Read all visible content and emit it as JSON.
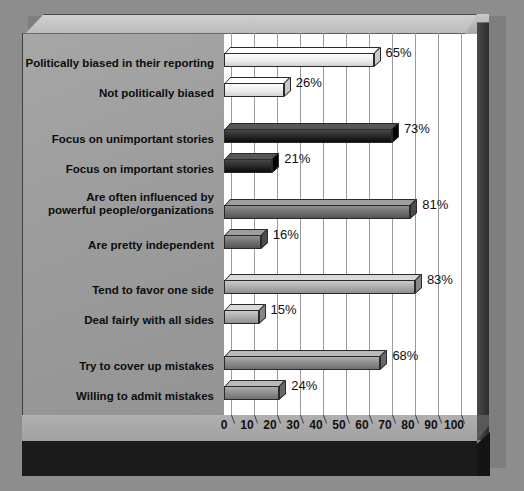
{
  "chart_data": {
    "type": "bar",
    "orientation": "horizontal",
    "title": "",
    "xlabel": "Percent",
    "ylabel": "",
    "xlim": [
      0,
      100
    ],
    "xticks": [
      0,
      10,
      20,
      30,
      40,
      50,
      60,
      70,
      80,
      90,
      100
    ],
    "grid": true,
    "legend": "none",
    "categories": [
      "Politically biased in their reporting",
      "Not politically biased",
      "Focus on unimportant stories",
      "Focus on important stories",
      "Are often influenced by powerful people/organizations",
      "Are pretty independent",
      "Tend to favor one side",
      "Deal fairly with all sides",
      "Try to cover up mistakes",
      "Willing to admit mistakes"
    ],
    "values": [
      65,
      26,
      73,
      21,
      81,
      16,
      83,
      15,
      68,
      24
    ],
    "value_labels": [
      "65%",
      "26%",
      "73%",
      "21%",
      "81%",
      "16%",
      "83%",
      "15%",
      "68%",
      "24%"
    ],
    "groups": [
      {
        "color": "#ececec",
        "items": [
          {
            "label": "Politically biased in their reporting",
            "value": 65,
            "value_label": "65%"
          },
          {
            "label": "Not politically biased",
            "value": 26,
            "value_label": "26%"
          }
        ]
      },
      {
        "color": "#262626",
        "items": [
          {
            "label": "Focus on unimportant stories",
            "value": 73,
            "value_label": "73%"
          },
          {
            "label": "Focus on important stories",
            "value": 21,
            "value_label": "21%"
          }
        ]
      },
      {
        "color": "#6e6e6e",
        "items": [
          {
            "label": "Are often influenced by powerful people/organizations",
            "value": 81,
            "value_label": "81%"
          },
          {
            "label": "Are pretty independent",
            "value": 16,
            "value_label": "16%"
          }
        ]
      },
      {
        "color": "#a9a9a9",
        "items": [
          {
            "label": "Tend to favor one side",
            "value": 83,
            "value_label": "83%"
          },
          {
            "label": "Deal fairly with all sides",
            "value": 15,
            "value_label": "15%"
          }
        ]
      },
      {
        "color": "#8a8a8a",
        "items": [
          {
            "label": "Try to cover up mistakes",
            "value": 68,
            "value_label": "68%"
          },
          {
            "label": "Willing to admit mistakes",
            "value": 24,
            "value_label": "24%"
          }
        ]
      }
    ]
  },
  "axis": {
    "x_title": "Percent"
  },
  "bars": [
    {
      "id": "politically-biased-in-their-reporting",
      "label": "Politically biased in their reporting",
      "label_lines": [
        "Politically biased in their reporting"
      ],
      "value": 65,
      "value_label": "65%",
      "color": "#ececec",
      "top": 47,
      "label_top": 57
    },
    {
      "id": "not-politically-biased",
      "label": "Not politically biased",
      "label_lines": [
        "Not politically biased"
      ],
      "value": 26,
      "value_label": "26%",
      "color": "#ececec",
      "top": 77,
      "label_top": 87
    },
    {
      "id": "focus-on-unimportant-stories",
      "label": "Focus on unimportant stories",
      "label_lines": [
        "Focus on unimportant stories"
      ],
      "value": 73,
      "value_label": "73%",
      "color": "#262626",
      "top": 123,
      "label_top": 133
    },
    {
      "id": "focus-on-important-stories",
      "label": "Focus on important stories",
      "label_lines": [
        "Focus on important stories"
      ],
      "value": 21,
      "value_label": "21%",
      "color": "#262626",
      "top": 153,
      "label_top": 163
    },
    {
      "id": "are-often-influenced-by-powerful-people-organizations",
      "label": "Are often influenced by powerful people/organizations",
      "label_lines": [
        "Are often influenced by",
        "powerful people/organizations"
      ],
      "value": 81,
      "value_label": "81%",
      "color": "#6e6e6e",
      "top": 199,
      "label_top": 191
    },
    {
      "id": "are-pretty-independent",
      "label": "Are pretty independent",
      "label_lines": [
        "Are pretty independent"
      ],
      "value": 16,
      "value_label": "16%",
      "color": "#6e6e6e",
      "top": 229,
      "label_top": 239
    },
    {
      "id": "tend-to-favor-one-side",
      "label": "Tend to favor one side",
      "label_lines": [
        "Tend to favor one side"
      ],
      "value": 83,
      "value_label": "83%",
      "color": "#a9a9a9",
      "top": 274,
      "label_top": 284
    },
    {
      "id": "deal-fairly-with-all-sides",
      "label": "Deal fairly with all sides",
      "label_lines": [
        "Deal fairly with all sides"
      ],
      "value": 15,
      "value_label": "15%",
      "color": "#a9a9a9",
      "top": 304,
      "label_top": 314
    },
    {
      "id": "try-to-cover-up-mistakes",
      "label": "Try to cover up mistakes",
      "label_lines": [
        "Try to cover up mistakes"
      ],
      "value": 68,
      "value_label": "68%",
      "color": "#8a8a8a",
      "top": 350,
      "label_top": 360
    },
    {
      "id": "willing-to-admit-mistakes",
      "label": "Willing to admit mistakes",
      "label_lines": [
        "Willing to admit mistakes"
      ],
      "value": 24,
      "value_label": "24%",
      "color": "#8a8a8a",
      "top": 380,
      "label_top": 390
    }
  ],
  "ticks": [
    {
      "value": 0,
      "label": "0"
    },
    {
      "value": 10,
      "label": "10"
    },
    {
      "value": 20,
      "label": "20"
    },
    {
      "value": 30,
      "label": "30"
    },
    {
      "value": 40,
      "label": "40"
    },
    {
      "value": 50,
      "label": "50"
    },
    {
      "value": 60,
      "label": "60"
    },
    {
      "value": 70,
      "label": "70"
    },
    {
      "value": 80,
      "label": "80"
    },
    {
      "value": 90,
      "label": "90"
    },
    {
      "value": 100,
      "label": "100"
    }
  ],
  "colors": {
    "background": "#8d8d8d",
    "panel": "#9c9c9c",
    "plot": "#ffffff",
    "plinth": "#1b1b1b",
    "axis_title_color": "#ffffff"
  }
}
